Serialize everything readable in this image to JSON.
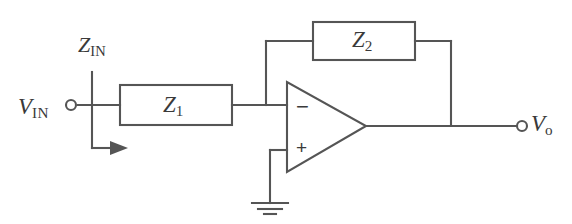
{
  "figure": {
    "kind": "circuit-schematic",
    "background_color": "#ffffff",
    "line_color": "#555555",
    "text_color": "#3a3a3a"
  },
  "labels": {
    "input_voltage": {
      "symbol": "V",
      "subscript": "IN",
      "text": "V_IN"
    },
    "input_impedance": {
      "symbol": "Z",
      "subscript": "IN",
      "text": "Z_IN"
    },
    "output_voltage": {
      "symbol": "V",
      "subscript": "o",
      "text": "V_o"
    },
    "series_impedance": {
      "symbol": "Z",
      "subscript": "1",
      "text": "Z_1"
    },
    "feedback_impedance": {
      "symbol": "Z",
      "subscript": "2",
      "text": "Z_2"
    },
    "inverting_input_sign": "−",
    "noninverting_input_sign": "+"
  },
  "components": [
    {
      "name": "impedance-z1",
      "label": "Z_1",
      "role": "series input impedance"
    },
    {
      "name": "impedance-z2",
      "label": "Z_2",
      "role": "feedback impedance"
    },
    {
      "name": "op-amp",
      "label": "",
      "role": "operational amplifier"
    },
    {
      "name": "ground",
      "label": "",
      "role": "ground reference"
    }
  ],
  "terminals": [
    {
      "name": "input-terminal",
      "label": "V_IN"
    },
    {
      "name": "output-terminal",
      "label": "V_o"
    }
  ],
  "annotations": [
    {
      "name": "input-current-arrow",
      "note": "arrow indicating input current direction at Z_IN node"
    }
  ]
}
